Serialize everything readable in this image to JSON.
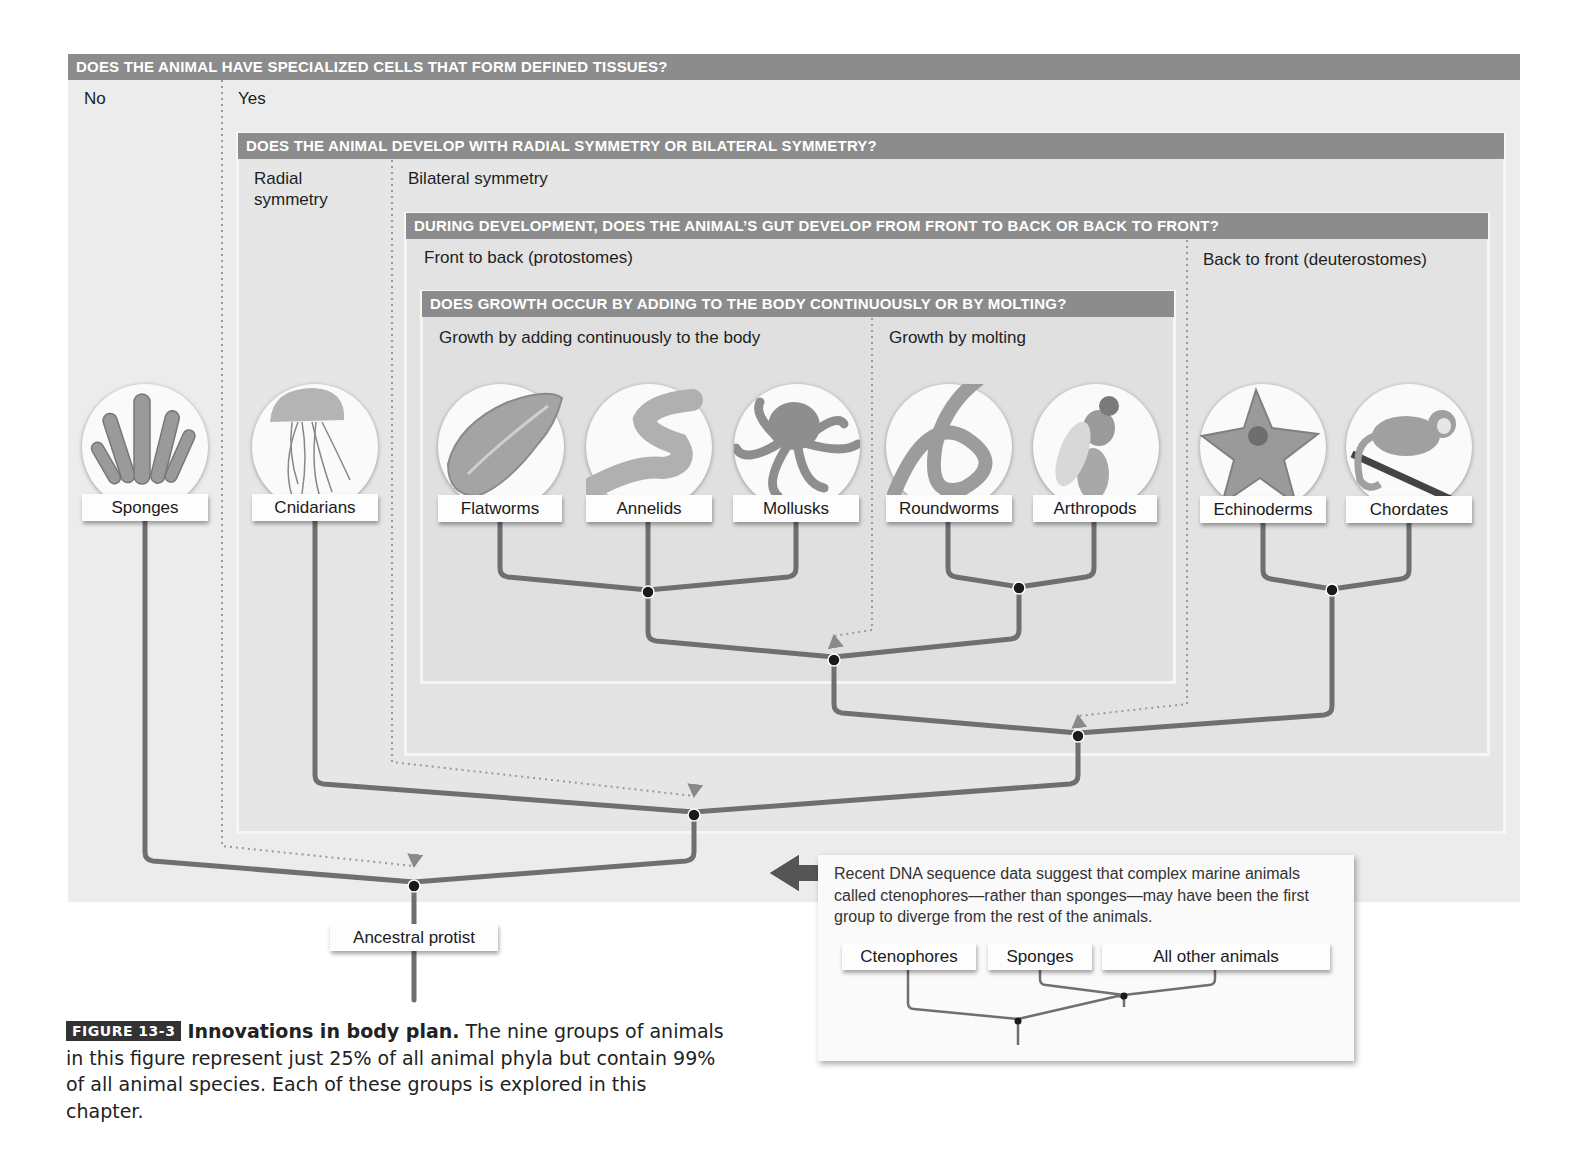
{
  "questions": {
    "q1": {
      "text": "DOES THE ANIMAL HAVE SPECIALIZED CELLS THAT FORM DEFINED TISSUES?",
      "answers": [
        "No",
        "Yes"
      ]
    },
    "q2": {
      "text": "DOES THE ANIMAL DEVELOP WITH RADIAL SYMMETRY OR BILATERAL SYMMETRY?",
      "answers": [
        "Radial symmetry",
        "Bilateral symmetry"
      ]
    },
    "q3": {
      "text": "DURING DEVELOPMENT, DOES THE ANIMAL’S GUT DEVELOP FROM FRONT TO BACK OR BACK TO FRONT?",
      "answers": [
        "Front to back (protostomes)",
        "Back to front (deuterostomes)"
      ]
    },
    "q4": {
      "text": "DOES GROWTH OCCUR BY ADDING TO THE BODY CONTINUOUSLY OR BY MOLTING?",
      "answers": [
        "Growth by adding continuously to the body",
        "Growth by molting"
      ]
    }
  },
  "radial_line1": "Radial",
  "radial_line2": "symmetry",
  "groups": [
    {
      "name": "Sponges",
      "icon": "sponge-icon"
    },
    {
      "name": "Cnidarians",
      "icon": "jellyfish-icon"
    },
    {
      "name": "Flatworms",
      "icon": "flatworm-icon"
    },
    {
      "name": "Annelids",
      "icon": "earthworm-icon"
    },
    {
      "name": "Mollusks",
      "icon": "octopus-icon"
    },
    {
      "name": "Roundworms",
      "icon": "roundworm-icon"
    },
    {
      "name": "Arthropods",
      "icon": "fly-icon"
    },
    {
      "name": "Echinoderms",
      "icon": "starfish-icon"
    },
    {
      "name": "Chordates",
      "icon": "monkey-icon"
    }
  ],
  "root": {
    "label": "Ancestral protist"
  },
  "note": {
    "text": "Recent DNA sequence data suggest that complex marine animals called ctenophores—rather than sponges—may have been the first group to diverge from the rest of the animals.",
    "tree_labels": [
      "Ctenophores",
      "Sponges",
      "All other animals"
    ]
  },
  "caption": {
    "tag": "FIGURE 13-3",
    "title": "Innovations in body plan.",
    "body": " The nine groups of animals in this figure represent just 25% of all animal phyla but contain 99% of all animal species. Each of these groups is explored in this chapter."
  },
  "colors": {
    "question_bar": "#8c8c8c",
    "branch": "#6f6f6f",
    "node": "#1a1a1a",
    "panel_bg": "#ececec"
  }
}
